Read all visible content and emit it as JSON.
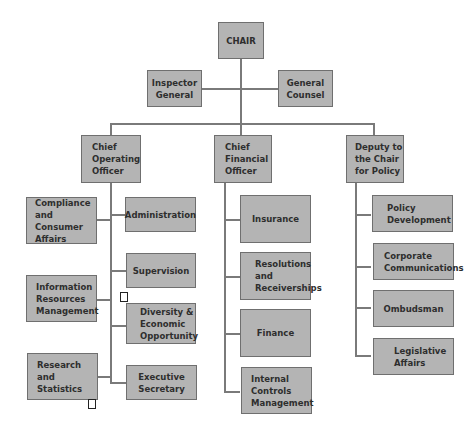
{
  "chair": {
    "label": "CHAIR"
  },
  "staff": [
    {
      "label": "Inspector\nGeneral"
    },
    {
      "label": "General\nCounsel"
    }
  ],
  "divisions": [
    {
      "label": "Chief\nOperating\nOfficer",
      "units_left": [
        {
          "label": "Compliance\nand Consumer\nAffairs"
        },
        {
          "label": "Information\nResources\nManagement"
        },
        {
          "label": "Research and\nStatistics"
        }
      ],
      "units_right": [
        {
          "label": "Administration"
        },
        {
          "label": "Supervision"
        },
        {
          "label": "Diversity &\nEconomic\nOpportunity"
        },
        {
          "label": "Executive\nSecretary"
        }
      ]
    },
    {
      "label": "Chief\nFinancial\nOfficer",
      "units": [
        {
          "label": "Insurance"
        },
        {
          "label": "Resolutions\nand\nReceiverships"
        },
        {
          "label": "Finance"
        },
        {
          "label": "Internal\nControls\nManagement"
        }
      ]
    },
    {
      "label": "Deputy to\nthe Chair\nfor Policy",
      "units": [
        {
          "label": "Policy\nDevelopment"
        },
        {
          "label": "Corporate\nCommunications"
        },
        {
          "label": "Ombudsman"
        },
        {
          "label": "Legislative\nAffairs"
        }
      ]
    }
  ],
  "colors": {
    "box_fill": "#b4b4b4",
    "box_border": "#6f6f6f",
    "connector": "#7a7a7a",
    "text": "#2e2e2e"
  }
}
